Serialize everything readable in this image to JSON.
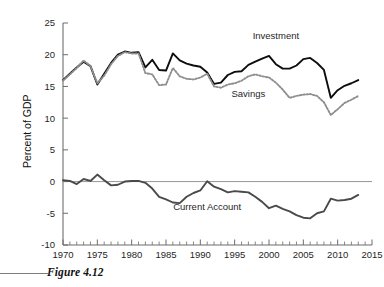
{
  "figure": {
    "caption": "Figure 4.12"
  },
  "chart_data": {
    "type": "line",
    "title": "",
    "xlabel": "",
    "ylabel": "Percent of GDP",
    "xlim": [
      1970,
      2015
    ],
    "ylim": [
      -10,
      25
    ],
    "grid": false,
    "legend_position": "inline-annotations",
    "x_ticks": [
      1970,
      1975,
      1980,
      1985,
      1990,
      1995,
      2000,
      2005,
      2010,
      2015
    ],
    "x_tick_labels": [
      "1970",
      "1975",
      "1980",
      "1985",
      "1990",
      "1995",
      "2000",
      "2005",
      "2010",
      "2015"
    ],
    "x_minor_tick_interval": 1,
    "y_ticks": [
      -10,
      -5,
      0,
      5,
      10,
      15,
      20,
      25
    ],
    "y_tick_labels": [
      "-10",
      "-5",
      "0",
      "5",
      "10",
      "15",
      "20",
      "25"
    ],
    "zero_line": true,
    "x": [
      1970,
      1971,
      1972,
      1973,
      1974,
      1975,
      1976,
      1977,
      1978,
      1979,
      1980,
      1981,
      1982,
      1983,
      1984,
      1985,
      1986,
      1987,
      1988,
      1989,
      1990,
      1991,
      1992,
      1993,
      1994,
      1995,
      1996,
      1997,
      1998,
      1999,
      2000,
      2001,
      2002,
      2003,
      2004,
      2005,
      2006,
      2007,
      2008,
      2009,
      2010,
      2011,
      2012,
      2013
    ],
    "series": [
      {
        "name": "Investment",
        "style": "solid",
        "color": "#0d0d0d",
        "label_x": 2001,
        "label_y": 22.4,
        "values": [
          16.0,
          17.0,
          18.0,
          18.9,
          18.2,
          15.3,
          17.0,
          18.7,
          20.0,
          20.5,
          20.3,
          20.4,
          18.0,
          19.2,
          17.6,
          17.5,
          20.2,
          19.1,
          18.6,
          18.3,
          18.1,
          17.2,
          15.4,
          15.6,
          16.8,
          17.3,
          17.4,
          18.4,
          18.9,
          19.4,
          19.8,
          18.5,
          17.8,
          17.8,
          18.3,
          19.3,
          19.5,
          18.7,
          17.6,
          13.2,
          14.4,
          15.1,
          15.5,
          16.0
        ]
      },
      {
        "name": "Savings",
        "style": "dotted",
        "color": "#8e8e8e",
        "label_x": 1997,
        "label_y": 13.3,
        "values": [
          15.9,
          16.9,
          17.9,
          19.1,
          18.2,
          15.5,
          16.7,
          18.5,
          19.8,
          20.4,
          20.2,
          20.2,
          17.1,
          16.9,
          15.2,
          15.3,
          17.9,
          16.6,
          16.2,
          16.1,
          16.4,
          17.0,
          15.0,
          14.8,
          15.3,
          15.5,
          15.9,
          16.6,
          16.9,
          16.6,
          16.4,
          15.6,
          14.5,
          13.2,
          13.5,
          13.7,
          13.8,
          13.5,
          12.5,
          10.5,
          11.4,
          12.4,
          12.9,
          13.5
        ]
      },
      {
        "name": "Current Account",
        "style": "solid",
        "color": "#4a4a4a",
        "label_x": 1991,
        "label_y": -4.5,
        "values": [
          0.2,
          0.1,
          -0.4,
          0.4,
          0.1,
          1.1,
          0.2,
          -0.6,
          -0.5,
          0.0,
          0.1,
          0.1,
          -0.2,
          -1.1,
          -2.4,
          -2.8,
          -3.3,
          -3.4,
          -2.4,
          -1.8,
          -1.4,
          0.05,
          -0.8,
          -1.2,
          -1.7,
          -1.5,
          -1.6,
          -1.7,
          -2.4,
          -3.2,
          -4.2,
          -3.8,
          -4.3,
          -4.7,
          -5.3,
          -5.7,
          -5.8,
          -5.0,
          -4.7,
          -2.7,
          -3.0,
          -2.9,
          -2.7,
          -2.1
        ]
      }
    ]
  }
}
